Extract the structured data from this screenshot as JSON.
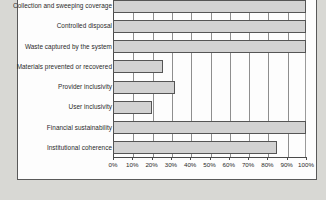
{
  "figure": {
    "frame_color": "#595959",
    "plot_background": "#fdfdfd",
    "page_background": "#d8d8d4"
  },
  "chart_data": {
    "type": "bar",
    "orientation": "horizontal",
    "title": "",
    "subtitle": "",
    "xlabel": "",
    "ylabel": "",
    "xlim": [
      0,
      100
    ],
    "xticks": [
      0,
      10,
      20,
      30,
      40,
      50,
      60,
      70,
      80,
      90,
      100
    ],
    "xtick_labels": [
      "0%",
      "10%",
      "20%",
      "30%",
      "40%",
      "50%",
      "60%",
      "70%",
      "80%",
      "90%",
      "100%"
    ],
    "grid": true,
    "grid_axis": "x",
    "legend": false,
    "bar_fill_color": "#d2d2d2",
    "bar_edge_color": "#555555",
    "categories": [
      "Collection and sweeping coverage",
      "Controlled disposal",
      "Waste captured by the system",
      "Materials prevented or recovered",
      "Provider inclusivity",
      "User inclusivity",
      "Financial sustainability",
      "Institutional coherence"
    ],
    "values": [
      100,
      100,
      100,
      26,
      32,
      20,
      100,
      85
    ]
  }
}
